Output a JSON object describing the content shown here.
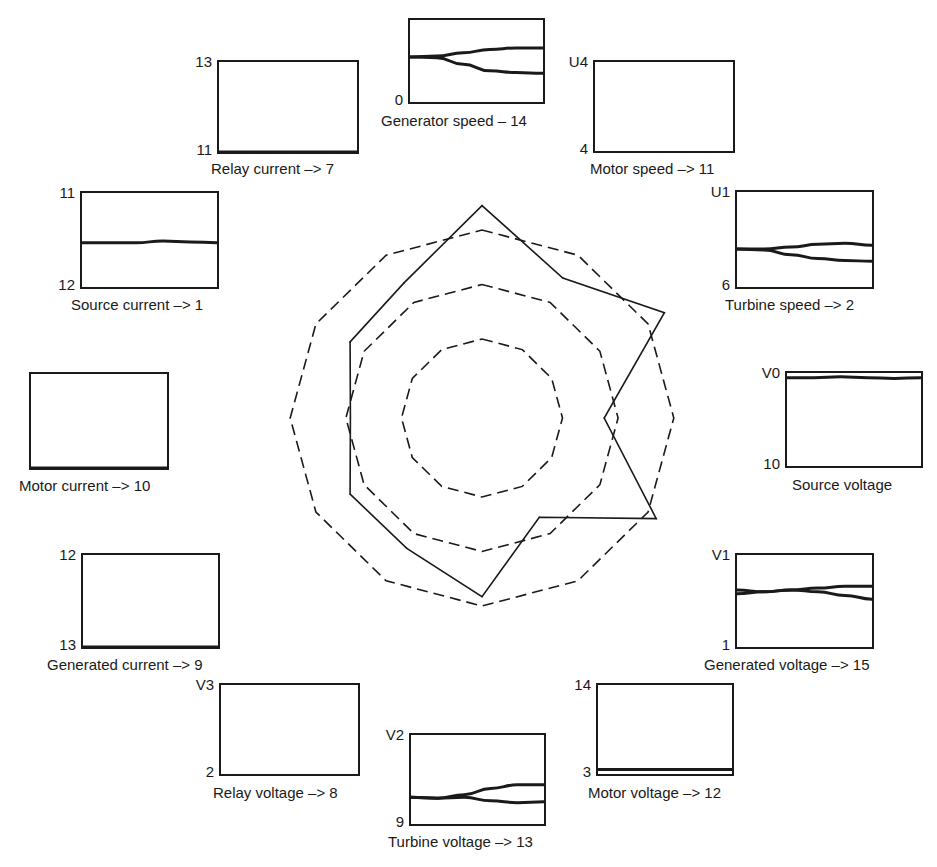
{
  "figure": {
    "title": "",
    "star_plot": {
      "axes_count": 12,
      "rings": [
        {
          "name": "inner",
          "style": "dashed",
          "level": 0.42
        },
        {
          "name": "middle",
          "style": "dashed",
          "level": 0.71
        },
        {
          "name": "outer",
          "style": "dashed",
          "level": 1.0
        }
      ],
      "profile_levels": [
        1.13,
        0.86,
        1.12,
        0.65,
        1.07,
        0.61,
        0.95,
        0.8,
        0.81,
        0.7,
        0.81,
        0.83
      ],
      "profile_style": "solid"
    },
    "panels": [
      {
        "id": "generator-speed",
        "caption": "Generator speed – 14",
        "top_label": "",
        "bottom_label": "0",
        "traces": [
          [
            0.55,
            0.56,
            0.6,
            0.64,
            0.66,
            0.66
          ],
          [
            0.55,
            0.54,
            0.46,
            0.38,
            0.36,
            0.35
          ]
        ]
      },
      {
        "id": "relay-current",
        "caption": "Relay current –> 7",
        "top_label": "13",
        "bottom_label": "11",
        "traces": [
          [
            0.0,
            0.0,
            0.0,
            0.0,
            0.0,
            0.0
          ]
        ]
      },
      {
        "id": "motor-speed",
        "caption": "Motor speed –> 11",
        "top_label": "U4",
        "bottom_label": "4",
        "traces": []
      },
      {
        "id": "source-current",
        "caption": "Source current –> 1",
        "top_label": "11",
        "bottom_label": "12",
        "traces": [
          [
            0.47,
            0.47,
            0.47,
            0.49,
            0.48,
            0.47
          ]
        ]
      },
      {
        "id": "turbine-speed",
        "caption": "Turbine speed –> 2",
        "top_label": "U1",
        "bottom_label": "6",
        "traces": [
          [
            0.4,
            0.4,
            0.42,
            0.45,
            0.46,
            0.44
          ],
          [
            0.4,
            0.39,
            0.34,
            0.3,
            0.28,
            0.27
          ]
        ]
      },
      {
        "id": "motor-current",
        "caption": "Motor current –> 10",
        "top_label": "",
        "bottom_label": "",
        "traces": [
          [
            0.0,
            0.0,
            0.0,
            0.0,
            0.0,
            0.0
          ]
        ]
      },
      {
        "id": "source-voltage",
        "caption": "Source voltage",
        "top_label": "V0",
        "bottom_label": "10",
        "traces": [
          [
            0.95,
            0.95,
            0.96,
            0.95,
            0.94,
            0.95
          ]
        ]
      },
      {
        "id": "generated-current",
        "caption": "Generated current –> 9",
        "top_label": "12",
        "bottom_label": "13",
        "traces": [
          [
            0.0,
            0.0,
            0.0,
            0.0,
            0.0,
            0.0
          ]
        ]
      },
      {
        "id": "generated-voltage",
        "caption": "Generated voltage –> 15",
        "top_label": "V1",
        "bottom_label": "1",
        "traces": [
          [
            0.62,
            0.6,
            0.62,
            0.64,
            0.66,
            0.66
          ],
          [
            0.58,
            0.6,
            0.62,
            0.6,
            0.56,
            0.52
          ]
        ]
      },
      {
        "id": "relay-voltage",
        "caption": "Relay voltage –> 8",
        "top_label": "V3",
        "bottom_label": "2",
        "traces": []
      },
      {
        "id": "turbine-voltage",
        "caption": "Turbine voltage –> 13",
        "top_label": "V2",
        "bottom_label": "9",
        "traces": [
          [
            0.3,
            0.29,
            0.33,
            0.4,
            0.44,
            0.44
          ],
          [
            0.3,
            0.29,
            0.3,
            0.26,
            0.24,
            0.25
          ]
        ]
      },
      {
        "id": "motor-voltage",
        "caption": "Motor voltage –> 12",
        "top_label": "14",
        "bottom_label": "3",
        "traces": [
          [
            0.05,
            0.05,
            0.05,
            0.05,
            0.05,
            0.05
          ]
        ]
      }
    ]
  }
}
